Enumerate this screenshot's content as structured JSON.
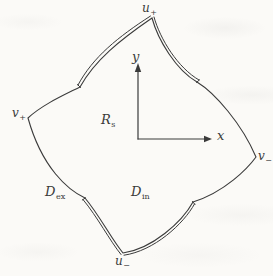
{
  "figure": {
    "colors": {
      "line": "#3a3a3a",
      "background": "#fbfaf7"
    },
    "labels": {
      "u_plus": {
        "main": "u",
        "sub": "+"
      },
      "u_minus": {
        "main": "u",
        "sub": "−"
      },
      "v_plus": {
        "main": "v",
        "sub": "+"
      },
      "v_minus": {
        "main": "v",
        "sub": "−"
      },
      "region_rs": {
        "main": "R",
        "sub": "s"
      },
      "domain_interior": {
        "main": "D",
        "sub": "in"
      },
      "domain_exterior": {
        "main": "D",
        "sub": "ex"
      },
      "axis_x": {
        "main": "x"
      },
      "axis_y": {
        "main": "y"
      }
    }
  }
}
